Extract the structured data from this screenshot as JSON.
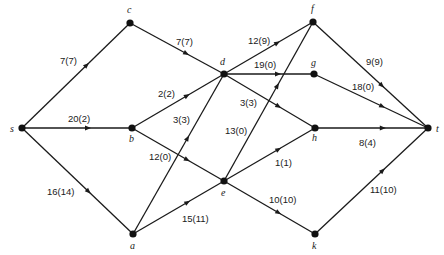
{
  "diagram": {
    "type": "flow-network",
    "nodes": [
      {
        "id": "s",
        "label": "s",
        "x": 22,
        "y": 128,
        "lx": 10,
        "ly": 132
      },
      {
        "id": "c",
        "label": "c",
        "x": 130,
        "y": 23,
        "lx": 127,
        "ly": 13
      },
      {
        "id": "b",
        "label": "b",
        "x": 132,
        "y": 128,
        "lx": 129,
        "ly": 142
      },
      {
        "id": "a",
        "label": "a",
        "x": 133,
        "y": 234,
        "lx": 130,
        "ly": 249
      },
      {
        "id": "d",
        "label": "d",
        "x": 224,
        "y": 74,
        "lx": 220,
        "ly": 65
      },
      {
        "id": "e",
        "label": "e",
        "x": 224,
        "y": 181,
        "lx": 221,
        "ly": 196
      },
      {
        "id": "f",
        "label": "f",
        "x": 313,
        "y": 22,
        "lx": 311,
        "ly": 12
      },
      {
        "id": "g",
        "label": "g",
        "x": 314,
        "y": 74,
        "lx": 311,
        "ly": 66
      },
      {
        "id": "h",
        "label": "h",
        "x": 315,
        "y": 128,
        "lx": 312,
        "ly": 141
      },
      {
        "id": "k",
        "label": "k",
        "x": 315,
        "y": 234,
        "lx": 312,
        "ly": 249
      },
      {
        "id": "t",
        "label": "t",
        "x": 428,
        "y": 128,
        "lx": 436,
        "ly": 132
      }
    ],
    "edges": [
      {
        "from": "s",
        "to": "c",
        "label": "7(7)",
        "capacity": 7,
        "flow": 7,
        "lx": 60,
        "ly": 64
      },
      {
        "from": "s",
        "to": "b",
        "label": "20(2)",
        "capacity": 20,
        "flow": 2,
        "lx": 68,
        "ly": 122
      },
      {
        "from": "s",
        "to": "a",
        "label": "16(14)",
        "capacity": 16,
        "flow": 14,
        "lx": 47,
        "ly": 195
      },
      {
        "from": "c",
        "to": "d",
        "label": "7(7)",
        "capacity": 7,
        "flow": 7,
        "lx": 176,
        "ly": 45
      },
      {
        "from": "b",
        "to": "d",
        "label": "2(2)",
        "capacity": 2,
        "flow": 2,
        "lx": 158,
        "ly": 97
      },
      {
        "from": "b",
        "to": "e",
        "label": "12(0)",
        "capacity": 12,
        "flow": 0,
        "lx": 149,
        "ly": 160
      },
      {
        "from": "a",
        "to": "d",
        "label": "3(3)",
        "capacity": 3,
        "flow": 3,
        "lx": 173,
        "ly": 123
      },
      {
        "from": "a",
        "to": "e",
        "label": "15(11)",
        "capacity": 15,
        "flow": 11,
        "lx": 182,
        "ly": 222
      },
      {
        "from": "d",
        "to": "f",
        "label": "12(9)",
        "capacity": 12,
        "flow": 9,
        "lx": 248,
        "ly": 44
      },
      {
        "from": "d",
        "to": "g",
        "label": "19(0)",
        "capacity": 19,
        "flow": 0,
        "lx": 254,
        "ly": 68
      },
      {
        "from": "d",
        "to": "h",
        "label": "3(3)",
        "capacity": 3,
        "flow": 3,
        "lx": 240,
        "ly": 106
      },
      {
        "from": "e",
        "to": "f",
        "label": "13(0)",
        "capacity": 13,
        "flow": 0,
        "lx": 225,
        "ly": 134
      },
      {
        "from": "e",
        "to": "h",
        "label": "1(1)",
        "capacity": 1,
        "flow": 1,
        "lx": 275,
        "ly": 166
      },
      {
        "from": "e",
        "to": "k",
        "label": "10(10)",
        "capacity": 10,
        "flow": 10,
        "lx": 269,
        "ly": 203
      },
      {
        "from": "f",
        "to": "t",
        "label": "9(9)",
        "capacity": 9,
        "flow": 9,
        "lx": 366,
        "ly": 65
      },
      {
        "from": "g",
        "to": "t",
        "label": "18(0)",
        "capacity": 18,
        "flow": 0,
        "lx": 352,
        "ly": 90
      },
      {
        "from": "h",
        "to": "t",
        "label": "8(4)",
        "capacity": 8,
        "flow": 4,
        "lx": 359,
        "ly": 146
      },
      {
        "from": "k",
        "to": "t",
        "label": "11(10)",
        "capacity": 11,
        "flow": 10,
        "lx": 370,
        "ly": 193
      }
    ]
  }
}
